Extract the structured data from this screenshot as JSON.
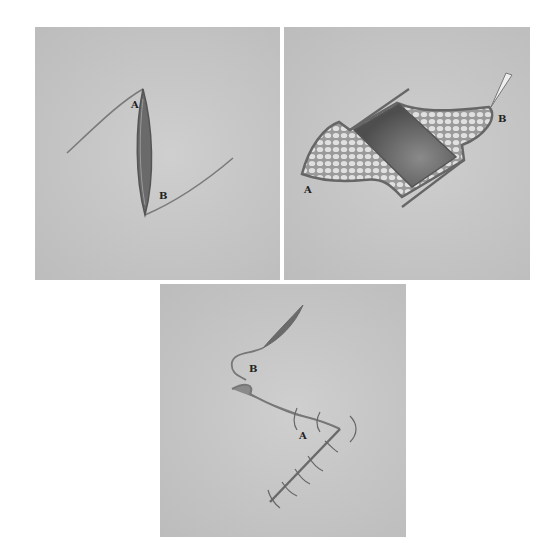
{
  "figure": {
    "panels": [
      {
        "id": "panel-1",
        "stage": "incision",
        "labels": {
          "a": "A",
          "b": "B"
        }
      },
      {
        "id": "panel-2",
        "stage": "flap-elevated",
        "labels": {
          "a": "A",
          "b": "B"
        }
      },
      {
        "id": "panel-3",
        "stage": "sutured-closure",
        "labels": {
          "a": "A",
          "b": "B"
        }
      }
    ],
    "colors": {
      "background": "#c4c4c4",
      "incision_line": "#6e6e6e",
      "wound_fill": "#5d5d5d",
      "fat_tissue": "#d8d8d8",
      "suture": "#555555"
    }
  }
}
